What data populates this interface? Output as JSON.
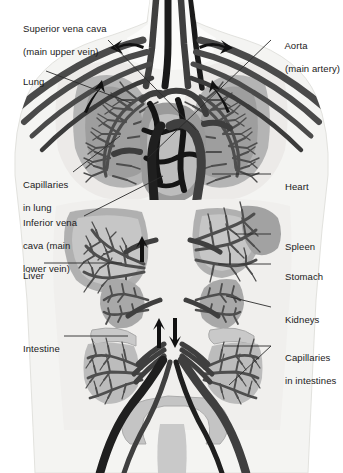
{
  "figure": {
    "background_color": "#ffffff",
    "body_silhouette_color": "#f2f2f0",
    "vessel_dark_color": "#4a4a4a",
    "vessel_black_color": "#141414",
    "organ_gray_color": "#a8a8a8",
    "organ_light_color": "#c9c9c9",
    "capillary_color": "#5a5a5a",
    "label_color": "#1a1a1a",
    "leader_line_color": "#2b2b2b"
  },
  "labels": [
    {
      "id": "superior-vena-cava",
      "lines": [
        "Superior vena cava",
        "(main upper vein)"
      ],
      "side": "left",
      "x": 12,
      "y": 11
    },
    {
      "id": "lung",
      "lines": [
        "Lung"
      ],
      "side": "left",
      "x": 12,
      "y": 64
    },
    {
      "id": "capillaries-in-lung",
      "lines": [
        "Capillaries",
        "in lung"
      ],
      "side": "left",
      "x": 12,
      "y": 167
    },
    {
      "id": "inferior-vena-cava",
      "lines": [
        "Inferior vena",
        "cava (main",
        "lower vein)"
      ],
      "side": "left",
      "x": 12,
      "y": 205
    },
    {
      "id": "liver",
      "lines": [
        "Liver"
      ],
      "side": "left",
      "x": 12,
      "y": 258
    },
    {
      "id": "intestine",
      "lines": [
        "Intestine"
      ],
      "side": "left",
      "x": 12,
      "y": 331
    },
    {
      "id": "aorta",
      "lines": [
        "Aorta",
        "(main artery)"
      ],
      "side": "right",
      "x": 274,
      "y": 28
    },
    {
      "id": "heart",
      "lines": [
        "Heart"
      ],
      "side": "right",
      "x": 274,
      "y": 169
    },
    {
      "id": "spleen",
      "lines": [
        "Spleen"
      ],
      "side": "right",
      "x": 274,
      "y": 229
    },
    {
      "id": "stomach",
      "lines": [
        "Stomach"
      ],
      "side": "right",
      "x": 274,
      "y": 259
    },
    {
      "id": "kidneys",
      "lines": [
        "Kidneys"
      ],
      "side": "right",
      "x": 274,
      "y": 302
    },
    {
      "id": "capillaries-in-intestines",
      "lines": [
        "Capillaries",
        "in intestines"
      ],
      "side": "right",
      "x": 274,
      "y": 340
    }
  ],
  "leader_lines": [
    {
      "id": "leader-superior-vena-cava",
      "x1": 108,
      "y1": 40,
      "x2": 196,
      "y2": 130
    },
    {
      "id": "leader-lung",
      "x1": 46,
      "y1": 71,
      "x2": 131,
      "y2": 103
    },
    {
      "id": "leader-capillaries-in-lung",
      "x1": 73,
      "y1": 172,
      "x2": 120,
      "y2": 136
    },
    {
      "id": "leader-inferior-vena-cava",
      "x1": 84,
      "y1": 216,
      "x2": 163,
      "y2": 176
    },
    {
      "id": "leader-liver",
      "x1": 44,
      "y1": 263,
      "x2": 122,
      "y2": 263
    },
    {
      "id": "leader-intestine",
      "x1": 64,
      "y1": 336,
      "x2": 128,
      "y2": 336
    },
    {
      "id": "leader-aorta",
      "x1": 271,
      "y1": 40,
      "x2": 148,
      "y2": 158
    },
    {
      "id": "leader-heart",
      "x1": 271,
      "y1": 174,
      "x2": 212,
      "y2": 174
    },
    {
      "id": "leader-spleen",
      "x1": 271,
      "y1": 234,
      "x2": 236,
      "y2": 234
    },
    {
      "id": "leader-stomach",
      "x1": 271,
      "y1": 264,
      "x2": 218,
      "y2": 264
    },
    {
      "id": "leader-kidneys",
      "x1": 271,
      "y1": 307,
      "x2": 226,
      "y2": 296
    },
    {
      "id": "leader-capillaries-intestines-a",
      "x1": 271,
      "y1": 346,
      "x2": 224,
      "y2": 346
    },
    {
      "id": "leader-capillaries-intestines-b",
      "x1": 271,
      "y1": 346,
      "x2": 229,
      "y2": 385
    }
  ],
  "flow_arrows": [
    {
      "id": "arrow-left-clavicle",
      "direction": "left",
      "x": 120,
      "y": 48
    },
    {
      "id": "arrow-right-clavicle",
      "direction": "right",
      "x": 232,
      "y": 48
    },
    {
      "id": "arrow-left-lung-up",
      "direction": "up",
      "x": 92,
      "y": 92
    },
    {
      "id": "arrow-right-lung-up",
      "direction": "up",
      "x": 222,
      "y": 92
    },
    {
      "id": "arrow-liver-up",
      "direction": "up",
      "x": 142,
      "y": 247
    },
    {
      "id": "arrow-aorta-up",
      "direction": "up",
      "x": 160,
      "y": 330
    },
    {
      "id": "arrow-vena-cava-down",
      "direction": "down",
      "x": 176,
      "y": 330
    }
  ]
}
